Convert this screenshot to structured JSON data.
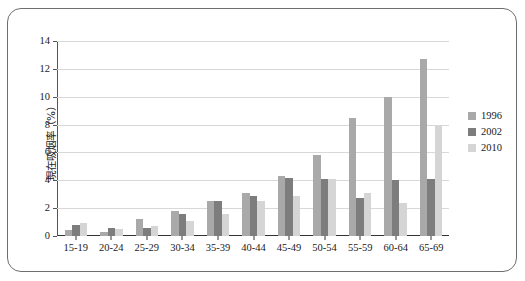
{
  "chart_data": {
    "type": "bar",
    "title": "",
    "xlabel": "",
    "ylabel": "現在吸烟率（%）",
    "ylim": [
      0,
      14
    ],
    "yticks": [
      0,
      2,
      4,
      6,
      8,
      10,
      12,
      14
    ],
    "grid": true,
    "legend_position": "right",
    "categories": [
      "15-19",
      "20-24",
      "25-29",
      "30-34",
      "35-39",
      "40-44",
      "45-49",
      "50-54",
      "55-59",
      "60-64",
      "65-69"
    ],
    "series": [
      {
        "name": "1996",
        "color": "#a9a9a9",
        "values": [
          0.4,
          0.3,
          1.2,
          1.8,
          2.5,
          3.1,
          4.3,
          5.8,
          8.5,
          10.0,
          12.7
        ]
      },
      {
        "name": "2002",
        "color": "#7d7d7d",
        "values": [
          0.8,
          0.6,
          0.6,
          1.6,
          2.5,
          2.9,
          4.2,
          4.1,
          2.7,
          4.0,
          4.1
        ]
      },
      {
        "name": "2010",
        "color": "#d5d5d5",
        "values": [
          0.9,
          0.5,
          0.7,
          1.1,
          1.6,
          2.5,
          2.9,
          4.1,
          3.1,
          2.4,
          7.9
        ]
      }
    ]
  },
  "legend": {
    "items": [
      {
        "label": "1996",
        "color": "#a9a9a9"
      },
      {
        "label": "2002",
        "color": "#7d7d7d"
      },
      {
        "label": "2010",
        "color": "#d5d5d5"
      }
    ]
  }
}
